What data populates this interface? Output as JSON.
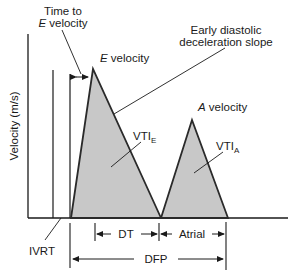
{
  "diagram": {
    "axis": {
      "ylabel": "Velocity (m/s)"
    },
    "labels": {
      "time_to_e_line1": "Time to",
      "time_to_e_italic": "E",
      "time_to_e_line2_rest": " velocity",
      "early_slope_line1": "Early diastolic",
      "early_slope_line2": "deceleration slope",
      "e_velocity_italic": "E",
      "e_velocity_rest": " velocity",
      "a_velocity_italic": "A",
      "a_velocity_rest": " velocity",
      "vti_e_main": "VTI",
      "vti_e_sub": "E",
      "vti_a_main": "VTI",
      "vti_a_sub": "A",
      "ivrt": "IVRT",
      "dt": "DT",
      "atrial": "Atrial",
      "dfp": "DFP"
    },
    "colors": {
      "fill": "#c8c8c8",
      "stroke": "#2a2a2a",
      "text": "#1a1a1a"
    }
  }
}
